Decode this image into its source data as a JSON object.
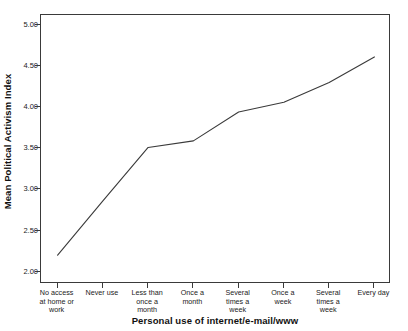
{
  "chart_data": {
    "type": "line",
    "title": "",
    "xlabel": "Personal use of internet/e-mail/www",
    "ylabel": "Mean Political Activism Index",
    "categories": [
      "No access at home or work",
      "Never use",
      "Less than once a month",
      "Once a month",
      "Several times a week",
      "Once a week",
      "Several times a week",
      "Every day"
    ],
    "category_lines": [
      [
        "No access",
        "at home or",
        "work"
      ],
      [
        "Never use"
      ],
      [
        "Less than",
        "once a",
        "month"
      ],
      [
        "Once a",
        "month"
      ],
      [
        "Several",
        "times a",
        "week"
      ],
      [
        "Once a",
        "week"
      ],
      [
        "Several",
        "times a",
        "week"
      ],
      [
        "Every day"
      ]
    ],
    "values": [
      2.2,
      2.86,
      3.51,
      3.59,
      3.94,
      4.06,
      4.3,
      4.61
    ],
    "ylim": [
      1.85,
      5.12
    ],
    "yticks": [
      2.0,
      2.5,
      3.0,
      3.5,
      4.0,
      4.5,
      5.0
    ],
    "ytick_labels": [
      "2.00",
      "2.50",
      "3.00",
      "3.50",
      "4.00",
      "4.50",
      "5.00"
    ],
    "grid": false,
    "legend": false,
    "line_color": "#3a3a3a",
    "frame_color": "#3a3a3a",
    "background_color": "#ffffff"
  }
}
